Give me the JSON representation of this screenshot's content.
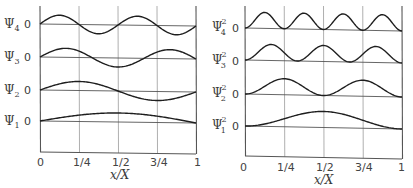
{
  "figure": {
    "colors": {
      "curve": "#1e1e1e",
      "axis": "#555555",
      "grid": "#9a9a9a",
      "text": "#3a3a3a",
      "background": "#ffffff"
    }
  },
  "chart_data": [
    {
      "type": "line",
      "title": "",
      "xlabel": "x/X",
      "ylabel": "",
      "x_ticks": [
        "0",
        "1/4",
        "1/2",
        "3/4",
        "1"
      ],
      "xlim": [
        0,
        1
      ],
      "grid": "vertical at quarters",
      "series": [
        {
          "name": "Ψ4",
          "label": "Ψ",
          "sub": "4",
          "zero_label": "0",
          "n": 4,
          "function": "sin(4πx/X)"
        },
        {
          "name": "Ψ3",
          "label": "Ψ",
          "sub": "3",
          "zero_label": "0",
          "n": 3,
          "function": "sin(3πx/X)"
        },
        {
          "name": "Ψ2",
          "label": "Ψ",
          "sub": "2",
          "zero_label": "0",
          "n": 2,
          "function": "sin(2πx/X)"
        },
        {
          "name": "Ψ1",
          "label": "Ψ",
          "sub": "1",
          "zero_label": "0",
          "n": 1,
          "function": "sin(πx/X)"
        }
      ]
    },
    {
      "type": "line",
      "title": "",
      "xlabel": "x/X",
      "ylabel": "",
      "x_ticks": [
        "0",
        "1/4",
        "1/2",
        "3/4",
        "1"
      ],
      "xlim": [
        0,
        1
      ],
      "grid": "vertical at quarters",
      "series": [
        {
          "name": "Ψ4²",
          "label": "Ψ",
          "sub": "4",
          "sup": "2",
          "zero_label": "0",
          "n": 4,
          "function": "sin²(4πx/X)"
        },
        {
          "name": "Ψ3²",
          "label": "Ψ",
          "sub": "3",
          "sup": "2",
          "zero_label": "0",
          "n": 3,
          "function": "sin²(3πx/X)"
        },
        {
          "name": "Ψ2²",
          "label": "Ψ",
          "sub": "2",
          "sup": "2",
          "zero_label": "0",
          "n": 2,
          "function": "sin²(2πx/X)"
        },
        {
          "name": "Ψ1²",
          "label": "Ψ",
          "sub": "1",
          "sup": "2",
          "zero_label": "0",
          "n": 1,
          "function": "sin²(πx/X)"
        }
      ]
    }
  ]
}
